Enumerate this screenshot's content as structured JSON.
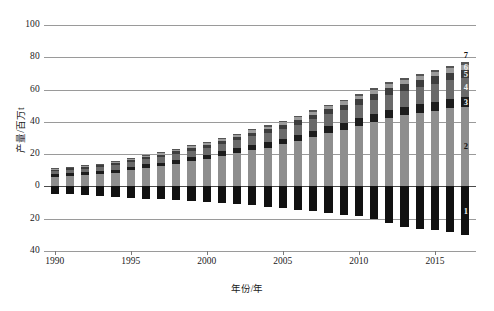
{
  "chart_data": {
    "type": "bar",
    "stacked": true,
    "title": "",
    "xlabel": "年份/年",
    "ylabel": "产量/百万t",
    "xlim": [
      1989.3,
      2017.7
    ],
    "ylim": [
      -40,
      100
    ],
    "ytick_values": [
      100,
      80,
      60,
      40,
      20,
      0,
      -20,
      -40
    ],
    "ytick_labels": [
      "100",
      "80",
      "60",
      "40",
      "20",
      "0",
      "20",
      "40"
    ],
    "xtick_values": [
      1990,
      1995,
      2000,
      2005,
      2010,
      2015
    ],
    "xtick_labels": [
      "1990",
      "1995",
      "2000",
      "2005",
      "2010",
      "2015"
    ],
    "grid": true,
    "legend_position": "inline-right",
    "categories": [
      1990,
      1991,
      1992,
      1993,
      1994,
      1995,
      1996,
      1997,
      1998,
      1999,
      2000,
      2001,
      2002,
      2003,
      2004,
      2005,
      2006,
      2007,
      2008,
      2009,
      2010,
      2011,
      2012,
      2013,
      2014,
      2015,
      2016,
      2017
    ],
    "series": [
      {
        "name": "1",
        "label": "1",
        "color": "#111111",
        "values": [
          -4.5,
          -5.0,
          -5.5,
          -6.0,
          -6.5,
          -7.0,
          -7.5,
          -8.0,
          -8.5,
          -9.0,
          -9.5,
          -10.5,
          -11.0,
          -11.5,
          -12.5,
          -13.5,
          -14.5,
          -15.5,
          -16.5,
          -17.5,
          -18.5,
          -20.0,
          -22.5,
          -25.0,
          -26.5,
          -27.0,
          -28.0,
          -30.0
        ]
      },
      {
        "name": "2",
        "label": "2",
        "color": "#8e8e8e",
        "values": [
          6.0,
          6.5,
          7.0,
          7.5,
          8.5,
          10.0,
          11.5,
          12.5,
          14.0,
          15.5,
          17.0,
          19.0,
          20.5,
          22.5,
          24.0,
          26.0,
          28.0,
          30.5,
          33.0,
          35.0,
          37.5,
          40.0,
          42.5,
          44.0,
          45.5,
          47.0,
          48.5,
          49.5
        ]
      },
      {
        "name": "3",
        "label": "3",
        "color": "#1c1c1c",
        "values": [
          1.5,
          1.6,
          1.7,
          1.8,
          1.9,
          2.0,
          2.1,
          2.2,
          2.4,
          2.5,
          2.6,
          2.8,
          3.0,
          3.2,
          3.4,
          3.6,
          3.8,
          4.0,
          4.2,
          4.4,
          4.6,
          4.8,
          5.0,
          5.2,
          5.4,
          5.6,
          5.8,
          6.0
        ]
      },
      {
        "name": "4",
        "label": "4",
        "color": "#6a6a6a",
        "values": [
          2.0,
          2.1,
          2.3,
          2.5,
          2.7,
          2.9,
          3.2,
          3.4,
          3.7,
          4.0,
          4.3,
          4.6,
          5.0,
          5.3,
          5.7,
          6.1,
          6.5,
          7.0,
          7.4,
          7.9,
          8.4,
          8.9,
          9.4,
          9.9,
          10.4,
          10.9,
          11.4,
          11.9
        ]
      },
      {
        "name": "5",
        "label": "5",
        "color": "#3d3d3d",
        "values": [
          1.0,
          1.1,
          1.1,
          1.2,
          1.3,
          1.4,
          1.5,
          1.6,
          1.7,
          1.8,
          1.9,
          2.0,
          2.2,
          2.3,
          2.5,
          2.6,
          2.8,
          3.0,
          3.2,
          3.4,
          3.6,
          3.8,
          4.0,
          4.2,
          4.4,
          4.6,
          4.8,
          5.0
        ]
      },
      {
        "name": "6",
        "label": "6",
        "color": "#9b9b9b",
        "values": [
          0.6,
          0.6,
          0.7,
          0.7,
          0.8,
          0.8,
          0.9,
          0.9,
          1.0,
          1.1,
          1.1,
          1.2,
          1.3,
          1.4,
          1.5,
          1.6,
          1.7,
          1.8,
          1.9,
          2.0,
          2.1,
          2.2,
          2.3,
          2.4,
          2.5,
          2.6,
          2.7,
          2.8
        ]
      },
      {
        "name": "7",
        "label": "7",
        "color": "#555555",
        "values": [
          0.3,
          0.3,
          0.3,
          0.4,
          0.4,
          0.4,
          0.5,
          0.5,
          0.5,
          0.6,
          0.6,
          0.7,
          0.7,
          0.8,
          0.8,
          0.9,
          0.9,
          1.0,
          1.0,
          1.1,
          1.1,
          1.2,
          1.3,
          1.3,
          1.4,
          1.5,
          1.5,
          1.6
        ]
      }
    ],
    "annotations": [
      {
        "text": "7",
        "series": "7"
      },
      {
        "text": "6",
        "series": "6"
      },
      {
        "text": "5",
        "series": "5"
      },
      {
        "text": "4",
        "series": "4"
      },
      {
        "text": "3",
        "series": "3"
      },
      {
        "text": "2",
        "series": "2"
      },
      {
        "text": "1",
        "series": "1"
      }
    ]
  }
}
